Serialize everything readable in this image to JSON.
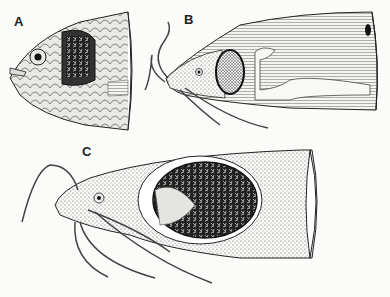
{
  "figure": {
    "panels": [
      {
        "id": "A",
        "label": "A",
        "subject": "fish head with scales, cutaway showing gill chamber"
      },
      {
        "id": "B",
        "label": "B",
        "subject": "catfish head with barbels, cutaway showing internal air-breathing organ"
      },
      {
        "id": "C",
        "label": "C",
        "subject": "catfish head with barbels, cutaway showing dendritic respiratory organ"
      }
    ]
  },
  "colors": {
    "ink": "#1a1a1a",
    "paper": "#fbfbf9",
    "stipple": "#7a7a7a"
  }
}
